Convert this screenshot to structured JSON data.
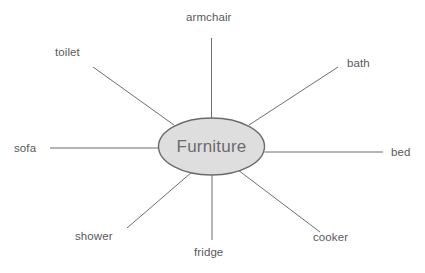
{
  "diagram": {
    "type": "radial-word-web",
    "center": {
      "label": "Furniture",
      "shape": "ellipse",
      "cx": 211.5,
      "cy": 146.5,
      "rx": 53,
      "ry": 28.5,
      "fill_color": "#dededf",
      "stroke_color": "#6b6b6f",
      "text_color": "#6b6b70"
    },
    "style": {
      "background_color": "#ffffff",
      "line_color": "#6e6e72",
      "label_color": "#59595d"
    },
    "branches": [
      {
        "id": "armchair",
        "label": "armchair",
        "direction": "top",
        "line": {
          "x1": 211.5,
          "y1": 118,
          "x2": 211.5,
          "y2": 38
        },
        "label_pos": {
          "left": 186,
          "top": 11
        }
      },
      {
        "id": "toilet",
        "label": "toilet",
        "direction": "upper-left",
        "line": {
          "x1": 174,
          "y1": 125,
          "x2": 93,
          "y2": 67
        },
        "label_pos": {
          "left": 55,
          "top": 46
        }
      },
      {
        "id": "bath",
        "label": "bath",
        "direction": "upper-right",
        "line": {
          "x1": 249,
          "y1": 125,
          "x2": 338,
          "y2": 67
        },
        "label_pos": {
          "left": 347,
          "top": 57
        }
      },
      {
        "id": "sofa",
        "label": "sofa",
        "direction": "left",
        "line": {
          "x1": 158.5,
          "y1": 148,
          "x2": 50,
          "y2": 148
        },
        "label_pos": {
          "left": 14,
          "top": 142
        }
      },
      {
        "id": "bed",
        "label": "bed",
        "direction": "right",
        "line": {
          "x1": 264.5,
          "y1": 152,
          "x2": 383,
          "y2": 152
        },
        "label_pos": {
          "left": 391,
          "top": 146
        }
      },
      {
        "id": "shower",
        "label": "shower",
        "direction": "lower-left",
        "line": {
          "x1": 192,
          "y1": 172,
          "x2": 127,
          "y2": 228
        },
        "label_pos": {
          "left": 75,
          "top": 230
        }
      },
      {
        "id": "fridge",
        "label": "fridge",
        "direction": "bottom",
        "line": {
          "x1": 212,
          "y1": 175,
          "x2": 212,
          "y2": 240
        },
        "label_pos": {
          "left": 194,
          "top": 246
        }
      },
      {
        "id": "cooker",
        "label": "cooker",
        "direction": "lower-right",
        "line": {
          "x1": 238,
          "y1": 170,
          "x2": 320,
          "y2": 232
        },
        "label_pos": {
          "left": 313,
          "top": 231
        }
      }
    ]
  }
}
